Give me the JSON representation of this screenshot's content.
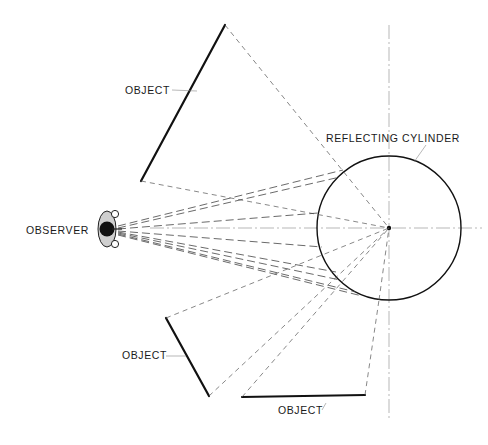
{
  "labels": {
    "object_top": "OBJECT",
    "object_left": "OBJECT",
    "object_bottom": "OBJECT",
    "observer": "OBSERVER",
    "cylinder": "REFLECTING CYLINDER"
  },
  "geometry": {
    "cylinder": {
      "cx": 389,
      "cy": 228,
      "r": 72
    },
    "observer": {
      "x": 107,
      "y": 229
    },
    "objects": [
      {
        "name": "object_top",
        "x1": 225,
        "y1": 25,
        "x2": 141,
        "y2": 181
      },
      {
        "name": "object_left",
        "x1": 166,
        "y1": 318,
        "x2": 209,
        "y2": 396
      },
      {
        "name": "object_bottom",
        "x1": 242,
        "y1": 397,
        "x2": 365,
        "y2": 395
      }
    ]
  },
  "colors": {
    "line": "#111111",
    "ray": "#444444",
    "axis": "#999999",
    "background": "#ffffff"
  }
}
